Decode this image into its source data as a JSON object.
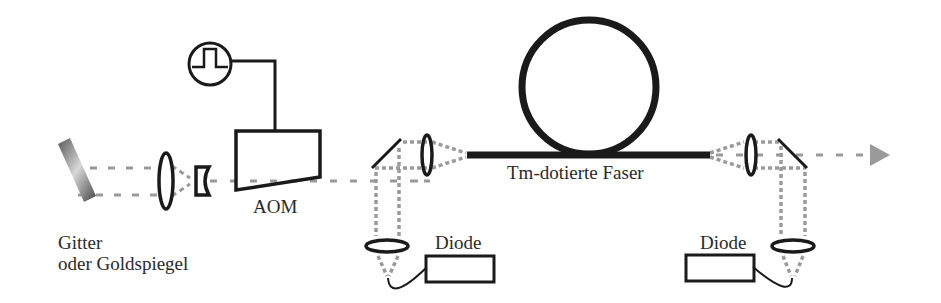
{
  "diagram": {
    "type": "optical-setup",
    "beam_color": "#9a9a9a",
    "line_color": "#1a1a1a",
    "components": [
      {
        "id": "grating-mirror",
        "kind": "mirror"
      },
      {
        "id": "lens-1",
        "kind": "convex-lens"
      },
      {
        "id": "lens-2",
        "kind": "concave-lens"
      },
      {
        "id": "pulse-generator",
        "kind": "signal-source",
        "icon": "square-pulse-icon"
      },
      {
        "id": "aom",
        "kind": "acousto-optic-modulator"
      },
      {
        "id": "dichroic-mirror-left",
        "kind": "mirror"
      },
      {
        "id": "coupling-lens-left",
        "kind": "lens"
      },
      {
        "id": "pump-lens-left",
        "kind": "lens"
      },
      {
        "id": "pump-diode-left",
        "kind": "diode"
      },
      {
        "id": "fiber",
        "kind": "doped-fiber-loop"
      },
      {
        "id": "coupling-lens-right",
        "kind": "lens"
      },
      {
        "id": "dichroic-mirror-right",
        "kind": "mirror"
      },
      {
        "id": "pump-lens-right",
        "kind": "lens"
      },
      {
        "id": "pump-diode-right",
        "kind": "diode"
      },
      {
        "id": "output-arrow",
        "kind": "output-beam"
      }
    ]
  },
  "labels": {
    "grating_line1": "Gitter",
    "grating_line2": "oder Goldspiegel",
    "aom": "AOM",
    "fiber": "Tm-dotierte Faser",
    "diode_left": "Diode",
    "diode_right": "Diode"
  }
}
